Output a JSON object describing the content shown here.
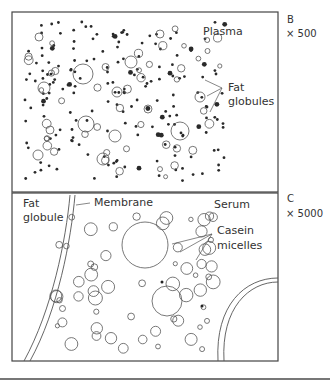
{
  "panel_b": {
    "letter": "B",
    "magnification": "× 500",
    "plasma_label": "Plasma",
    "fat_globules_line1": "Fat",
    "fat_globules_line2": "globules"
  },
  "panel_c": {
    "letter": "C",
    "magnification": "× 5000",
    "fat_globule_line1": "Fat",
    "fat_globule_line2": "globule",
    "membrane_label": "Membrane",
    "serum_label": "Serum",
    "casein_line1": "Casein",
    "casein_line2": "micelles"
  },
  "colors": {
    "stroke": "#444444",
    "dot": "#2a2a2a",
    "background": "#ffffff"
  }
}
